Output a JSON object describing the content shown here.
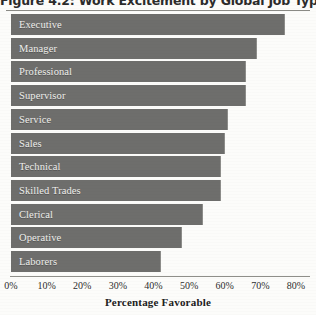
{
  "chart_data": {
    "type": "bar",
    "orientation": "horizontal",
    "title": "Figure 4.2: Work Excitement by Global Job Type",
    "xlabel": "Percentage Favorable",
    "ylabel": "",
    "xlim": [
      0,
      80
    ],
    "xticks": [
      "0%",
      "10%",
      "20%",
      "30%",
      "40%",
      "50%",
      "60%",
      "70%",
      "80%"
    ],
    "xtick_values": [
      0,
      10,
      20,
      30,
      40,
      50,
      60,
      70,
      80
    ],
    "grid": false,
    "legend": "none",
    "bar_color": "#6e6e6c",
    "label_color": "#efefec",
    "categories": [
      "Executive",
      "Manager",
      "Professional",
      "Supervisor",
      "Service",
      "Sales",
      "Technical",
      "Skilled Trades",
      "Clerical",
      "Operative",
      "Laborers"
    ],
    "values": [
      77,
      69,
      66,
      66,
      61,
      60,
      59,
      59,
      54,
      48,
      42
    ]
  }
}
